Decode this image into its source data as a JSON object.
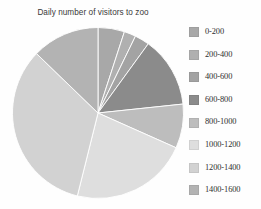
{
  "chart_data": {
    "type": "pie",
    "title": "Daily number of visitors to zoo",
    "xlabel": "",
    "ylabel": "",
    "legend_position": "right",
    "grid": false,
    "start_angle_deg": 0,
    "direction": "clockwise",
    "categories": [
      "0-200",
      "200-400",
      "400-600",
      "600-800",
      "800-1000",
      "1000-1200",
      "1200-1400",
      "1400-1600"
    ],
    "values": [
      5.0,
      2.2,
      2.8,
      13.3,
      8.3,
      22.2,
      33.3,
      12.9
    ],
    "angles_deg": [
      18,
      8,
      10,
      48,
      30,
      80,
      120,
      46
    ],
    "colors": [
      "#a8a8a8",
      "#b0b0b0",
      "#a3a3a3",
      "#8b8b8b",
      "#bdbdbd",
      "#dedede",
      "#d2d2d2",
      "#b3b3b3"
    ],
    "slices": [
      {
        "label": "0-200",
        "value": 5.0,
        "angle_deg": 18,
        "color": "#a8a8a8"
      },
      {
        "label": "200-400",
        "value": 2.2,
        "angle_deg": 8,
        "color": "#b0b0b0"
      },
      {
        "label": "400-600",
        "value": 2.8,
        "angle_deg": 10,
        "color": "#a3a3a3"
      },
      {
        "label": "600-800",
        "value": 13.3,
        "angle_deg": 48,
        "color": "#8b8b8b"
      },
      {
        "label": "800-1000",
        "value": 8.3,
        "angle_deg": 30,
        "color": "#bdbdbd"
      },
      {
        "label": "1000-1200",
        "value": 22.2,
        "angle_deg": 80,
        "color": "#dedede"
      },
      {
        "label": "1200-1400",
        "value": 33.3,
        "angle_deg": 120,
        "color": "#d2d2d2"
      },
      {
        "label": "1400-1600",
        "value": 12.9,
        "angle_deg": 46,
        "color": "#b3b3b3"
      }
    ]
  },
  "legend": {
    "items": [
      {
        "label": "0-200",
        "color": "#a8a8a8"
      },
      {
        "label": "200-400",
        "color": "#b0b0b0"
      },
      {
        "label": "400-600",
        "color": "#a3a3a3"
      },
      {
        "label": "600-800",
        "color": "#8b8b8b"
      },
      {
        "label": "800-1000",
        "color": "#bdbdbd"
      },
      {
        "label": "1000-1200",
        "color": "#dedede"
      },
      {
        "label": "1200-1400",
        "color": "#d2d2d2"
      },
      {
        "label": "1400-1600",
        "color": "#b3b3b3"
      }
    ]
  },
  "colors": {
    "background": "#fefefe",
    "title_text": "#3a3a3a",
    "legend_text": "#2e2e2e",
    "slice_divider": "#ffffff"
  }
}
